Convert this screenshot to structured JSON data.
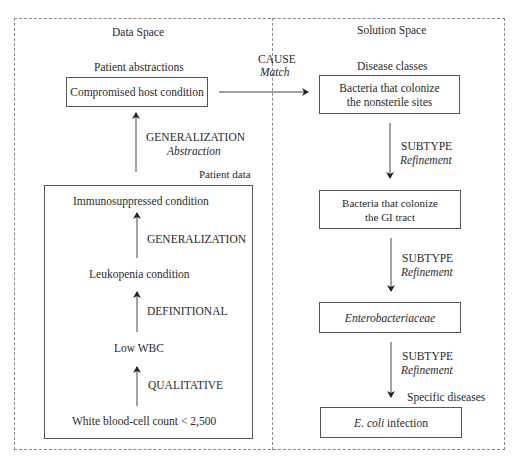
{
  "data_space": {
    "title": "Data Space",
    "abstractions_label": "Patient abstractions",
    "compromised_host": "Compromised host condition",
    "abstraction_arrow": {
      "relation": "GENERALIZATION",
      "type": "Abstraction"
    },
    "patient_data_label": "Patient data",
    "patient_data": {
      "immunosuppressed": "Immunosuppressed condition",
      "rel1": "GENERALIZATION",
      "leukopenia": "Leukopenia condition",
      "rel2": "DEFINITIONAL",
      "low_wbc": "Low WBC",
      "rel3": "QUALITATIVE",
      "wbc_count": "White blood-cell count < 2,500"
    }
  },
  "match_arrow": {
    "relation": "CAUSE",
    "type": "Match"
  },
  "solution_space": {
    "title": "Solution Space",
    "disease_classes_label": "Disease classes",
    "nonsterile_line1": "Bacteria that colonize",
    "nonsterile_line2": "the nonsterile sites",
    "refine1": {
      "relation": "SUBTYPE",
      "type": "Refinement"
    },
    "gi_line1": "Bacteria that colonize",
    "gi_line2": "the GI tract",
    "refine2": {
      "relation": "SUBTYPE",
      "type": "Refinement"
    },
    "enterobacteriaceae": "Enterobacteriaceae",
    "refine3": {
      "relation": "SUBTYPE",
      "type": "Refinement"
    },
    "specific_diseases_label": "Specific diseases",
    "ecoli_italic": "E. coli",
    "ecoli_rest": " infection"
  }
}
